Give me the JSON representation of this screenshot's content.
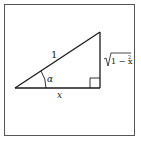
{
  "figure": {
    "type": "right-triangle",
    "hypotenuse_label": "1",
    "angle_label": "α",
    "base_label": "x",
    "vertical_leg_label_radical": "1 − x",
    "vertical_leg_label_exponent": "2",
    "vertical_leg_label_full": "√(1 − x²)",
    "right_angle_marker": true,
    "colors": {
      "stroke": "#1a1a1a",
      "frame": "#555555",
      "background": "#ffffff"
    }
  }
}
